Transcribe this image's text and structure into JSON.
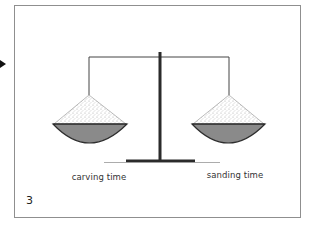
{
  "slide": {
    "number": "3",
    "pointer_icon": "play-arrow-icon"
  },
  "diagram": {
    "type": "balance-scale",
    "left_pan": {
      "label": "carving time"
    },
    "right_pan": {
      "label": "sanding time"
    },
    "balanced": true
  },
  "colors": {
    "frame_border": "#8f8f8f",
    "pole": "#2b2b2b",
    "bowl_fill": "#8a8a8a",
    "bowl_outline": "#2e2e2e",
    "stipple": "#9a9a9a",
    "text": "#333333"
  }
}
